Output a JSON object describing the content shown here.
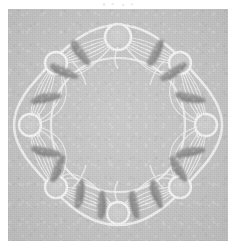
{
  "figure": {
    "title": "",
    "caption": "",
    "domain": "scientific figure",
    "canvas": {
      "width": 236,
      "height": 251
    },
    "plate": {
      "x": 8,
      "y": 9,
      "width": 220,
      "height": 232,
      "background_color": "#c9c9c9"
    },
    "page_background_color": "#ffffff",
    "top_artifact": {
      "label": "faint scanner speckle marks",
      "x": 100,
      "y": 2
    }
  },
  "graph_data": {
    "type": "network",
    "layout": "radial-ring",
    "node_count": 8,
    "node_color": "#f2f2f2",
    "node_stroke_color": "#f7f7f7",
    "edge_color": "#f4f4f4",
    "cluster_color": "#8e8e8e",
    "cluster_count": 16,
    "ring_center": {
      "x": 110,
      "y": 116
    },
    "ring_radius": 88,
    "nodes": [
      {
        "id": "n1",
        "label": "",
        "angle_deg": -90,
        "x": 110,
        "y": 28,
        "r": 13
      },
      {
        "id": "n2",
        "label": "",
        "angle_deg": -45,
        "x": 172,
        "y": 54,
        "r": 11
      },
      {
        "id": "n3",
        "label": "",
        "angle_deg": 0,
        "x": 198,
        "y": 116,
        "r": 11
      },
      {
        "id": "n4",
        "label": "",
        "angle_deg": 45,
        "x": 172,
        "y": 178,
        "r": 11
      },
      {
        "id": "n5",
        "label": "",
        "angle_deg": 90,
        "x": 110,
        "y": 204,
        "r": 11
      },
      {
        "id": "n6",
        "label": "",
        "angle_deg": 135,
        "x": 48,
        "y": 178,
        "r": 11
      },
      {
        "id": "n7",
        "label": "",
        "angle_deg": 180,
        "x": 22,
        "y": 116,
        "r": 11
      },
      {
        "id": "n8",
        "label": "",
        "angle_deg": -135,
        "x": 48,
        "y": 54,
        "r": 11
      }
    ],
    "clusters": [
      {
        "id": "c1",
        "near_nodes": [
          "n1",
          "n8"
        ],
        "x": 72,
        "y": 44,
        "angle_deg": 40,
        "dots": 6
      },
      {
        "id": "c2",
        "near_nodes": [
          "n1",
          "n8"
        ],
        "x": 56,
        "y": 62,
        "angle_deg": 22,
        "dots": 6
      },
      {
        "id": "c3",
        "near_nodes": [
          "n1",
          "n2"
        ],
        "x": 148,
        "y": 44,
        "angle_deg": -40,
        "dots": 6
      },
      {
        "id": "c4",
        "near_nodes": [
          "n1",
          "n2"
        ],
        "x": 166,
        "y": 62,
        "angle_deg": -22,
        "dots": 6
      },
      {
        "id": "c5",
        "near_nodes": [
          "n2",
          "n3"
        ],
        "x": 186,
        "y": 88,
        "angle_deg": 20,
        "dots": 6
      },
      {
        "id": "c6",
        "near_nodes": [
          "n3",
          "n4"
        ],
        "x": 186,
        "y": 144,
        "angle_deg": -20,
        "dots": 6
      },
      {
        "id": "c7",
        "near_nodes": [
          "n3",
          "n4"
        ],
        "x": 174,
        "y": 160,
        "angle_deg": 40,
        "dots": 6
      },
      {
        "id": "c8",
        "near_nodes": [
          "n4",
          "n5"
        ],
        "x": 152,
        "y": 186,
        "angle_deg": 68,
        "dots": 6
      },
      {
        "id": "c9",
        "near_nodes": [
          "n5",
          "n4"
        ],
        "x": 128,
        "y": 198,
        "angle_deg": 80,
        "dots": 6
      },
      {
        "id": "c10",
        "near_nodes": [
          "n5",
          "n6"
        ],
        "x": 96,
        "y": 198,
        "angle_deg": -80,
        "dots": 6
      },
      {
        "id": "c11",
        "near_nodes": [
          "n5",
          "n6"
        ],
        "x": 70,
        "y": 186,
        "angle_deg": -68,
        "dots": 6
      },
      {
        "id": "c12",
        "near_nodes": [
          "n6",
          "n7"
        ],
        "x": 46,
        "y": 160,
        "angle_deg": -40,
        "dots": 6
      },
      {
        "id": "c13",
        "near_nodes": [
          "n7",
          "n6"
        ],
        "x": 34,
        "y": 144,
        "angle_deg": 20,
        "dots": 6
      },
      {
        "id": "c14",
        "near_nodes": [
          "n7",
          "n8"
        ],
        "x": 34,
        "y": 88,
        "angle_deg": -20,
        "dots": 6
      },
      {
        "id": "c15",
        "near_nodes": [
          "n8",
          "n7"
        ],
        "x": 46,
        "y": 72,
        "angle_deg": 40,
        "dots": 6
      },
      {
        "id": "c16",
        "near_nodes": [
          "n2",
          "n3"
        ],
        "x": 174,
        "y": 72,
        "angle_deg": -40,
        "dots": 6
      }
    ],
    "edges": [
      {
        "from": "n1",
        "to": "n2",
        "style": "bundle"
      },
      {
        "from": "n2",
        "to": "n3",
        "style": "bundle"
      },
      {
        "from": "n3",
        "to": "n4",
        "style": "bundle"
      },
      {
        "from": "n4",
        "to": "n5",
        "style": "bundle"
      },
      {
        "from": "n5",
        "to": "n6",
        "style": "bundle"
      },
      {
        "from": "n6",
        "to": "n7",
        "style": "bundle"
      },
      {
        "from": "n7",
        "to": "n8",
        "style": "bundle"
      },
      {
        "from": "n8",
        "to": "n1",
        "style": "bundle"
      }
    ]
  }
}
